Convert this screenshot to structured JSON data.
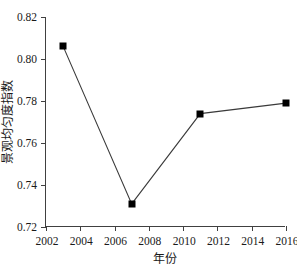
{
  "chart_data": {
    "type": "line",
    "title": "",
    "xlabel": "年份",
    "ylabel": "景观均匀度指数",
    "x": [
      2003,
      2007,
      2011,
      2016
    ],
    "values": [
      0.806,
      0.731,
      0.774,
      0.779
    ],
    "series": [
      {
        "name": "景观均匀度指数",
        "x": [
          2003,
          2007,
          2011,
          2016
        ],
        "values": [
          0.806,
          0.731,
          0.774,
          0.779
        ]
      }
    ],
    "xlim": [
      2002,
      2016
    ],
    "ylim": [
      0.72,
      0.82
    ],
    "xticks": [
      2002,
      2004,
      2006,
      2008,
      2010,
      2012,
      2014,
      2016
    ],
    "xtick_labels": [
      "2002",
      "2004",
      "2006",
      "2008",
      "2010",
      "2012",
      "2014",
      "2016"
    ],
    "yticks": [
      0.72,
      0.74,
      0.76,
      0.78,
      0.8,
      0.82
    ],
    "ytick_labels": [
      "0.72",
      "0.74",
      "0.76",
      "0.78",
      "0.80",
      "0.82"
    ],
    "grid": false,
    "legend": false,
    "marker": "square",
    "marker_color": "#000000",
    "line_color": "#3a3a3a",
    "axis_color": "#404040",
    "background": "#ffffff"
  }
}
